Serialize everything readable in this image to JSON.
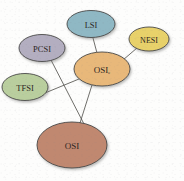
{
  "figure": {
    "type": "node-link-diagram",
    "background_color": "#fdfdfc",
    "width": 184,
    "height": 181
  },
  "chart_data": {
    "type": "diagram",
    "title": "",
    "nodes": [
      {
        "id": "LSI",
        "label": "LSI",
        "sublabel": "",
        "color": "#8fb8c4",
        "cx": 91,
        "cy": 24,
        "rx": 24,
        "ry": 13.5,
        "font_size": 8.5
      },
      {
        "id": "NESI",
        "label": "NESI",
        "sublabel": "",
        "color": "#e8d16a",
        "cx": 149,
        "cy": 39,
        "rx": 20,
        "ry": 12,
        "font_size": 8
      },
      {
        "id": "PCSI",
        "label": "PCSI",
        "sublabel": "",
        "color": "#b3aec0",
        "cx": 42,
        "cy": 48,
        "rx": 23,
        "ry": 13.5,
        "font_size": 8.5
      },
      {
        "id": "TFSI",
        "label": "TFSI",
        "sublabel": "",
        "color": "#b9ce9e",
        "cx": 25,
        "cy": 87,
        "rx": 23,
        "ry": 13.5,
        "font_size": 8.5
      },
      {
        "id": "OSIe",
        "label": "OSI",
        "sublabel": "e",
        "color": "#e8b87a",
        "cx": 102,
        "cy": 69,
        "rx": 28,
        "ry": 17,
        "font_size": 9
      },
      {
        "id": "OSI",
        "label": "OSI",
        "sublabel": "",
        "color": "#c08870",
        "cx": 72,
        "cy": 145,
        "rx": 35,
        "ry": 23,
        "font_size": 9
      }
    ],
    "edges": [
      {
        "from": "LSI",
        "to": "OSIe",
        "x1": 93,
        "y1": 38,
        "x2": 97,
        "y2": 53
      },
      {
        "from": "NESI",
        "to": "OSIe",
        "x1": 137,
        "y1": 48,
        "x2": 123,
        "y2": 60
      },
      {
        "from": "PCSI",
        "to": "OSI",
        "x1": 51,
        "y1": 60,
        "x2": 84,
        "y2": 124
      },
      {
        "from": "TFSI",
        "to": "OSIe",
        "x1": 45,
        "y1": 93,
        "x2": 79,
        "y2": 79
      },
      {
        "from": "OSIe",
        "to": "OSI",
        "x1": 92,
        "y1": 85,
        "x2": 80,
        "y2": 123
      }
    ],
    "legend": [],
    "annotations": []
  }
}
